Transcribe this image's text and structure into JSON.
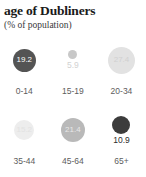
{
  "header": {
    "title": "age of Dubliners",
    "subtitle": "(% of population)"
  },
  "chart_data": {
    "type": "bar",
    "subtype": "proportional-bubble",
    "title": "age of Dubliners",
    "subtitle": "(% of population)",
    "xlabel": "",
    "ylabel": "% of population",
    "grid": false,
    "legend": "none",
    "categories": [
      "0-14",
      "15-19",
      "20-34",
      "35-44",
      "45-64",
      "65+"
    ],
    "values": [
      19.2,
      5.9,
      27.4,
      15.2,
      21.4,
      10.9
    ],
    "value_labels": [
      "19.2",
      "5.9",
      "27.4",
      "15.2",
      "21.4",
      "10.9"
    ],
    "bubbles": [
      {
        "category": "0-14",
        "value": 19.2,
        "label": "19.2",
        "diameter_px": 23,
        "fill": "#545454",
        "text_color": "#ffffff",
        "label_position": "inside"
      },
      {
        "category": "15-19",
        "value": 5.9,
        "label": "5.9",
        "diameter_px": 9,
        "fill": "#c8c8c8",
        "text_color": "#d2d2d2",
        "label_position": "below"
      },
      {
        "category": "20-34",
        "value": 27.4,
        "label": "27.4",
        "diameter_px": 27,
        "fill": "#e2e2e2",
        "text_color": "#d0d0d0",
        "label_position": "inside"
      },
      {
        "category": "35-44",
        "value": 15.2,
        "label": "15.2",
        "diameter_px": 20,
        "fill": "#ededed",
        "text_color": "#e2e2e2",
        "label_position": "inside"
      },
      {
        "category": "45-64",
        "value": 21.4,
        "label": "21.4",
        "diameter_px": 24,
        "fill": "#b9b9b9",
        "text_color": "#e8e8e8",
        "label_position": "inside"
      },
      {
        "category": "65+",
        "value": 10.9,
        "label": "10.9",
        "diameter_px": 18,
        "fill": "#3c3c3c",
        "text_color": "#2b2b2b",
        "label_position": "below"
      }
    ],
    "colors": {
      "title_text": "#1a1a1a",
      "subtitle_text": "#3a3a3a",
      "category_text": "#5d5d5d",
      "background": "#ffffff"
    }
  }
}
